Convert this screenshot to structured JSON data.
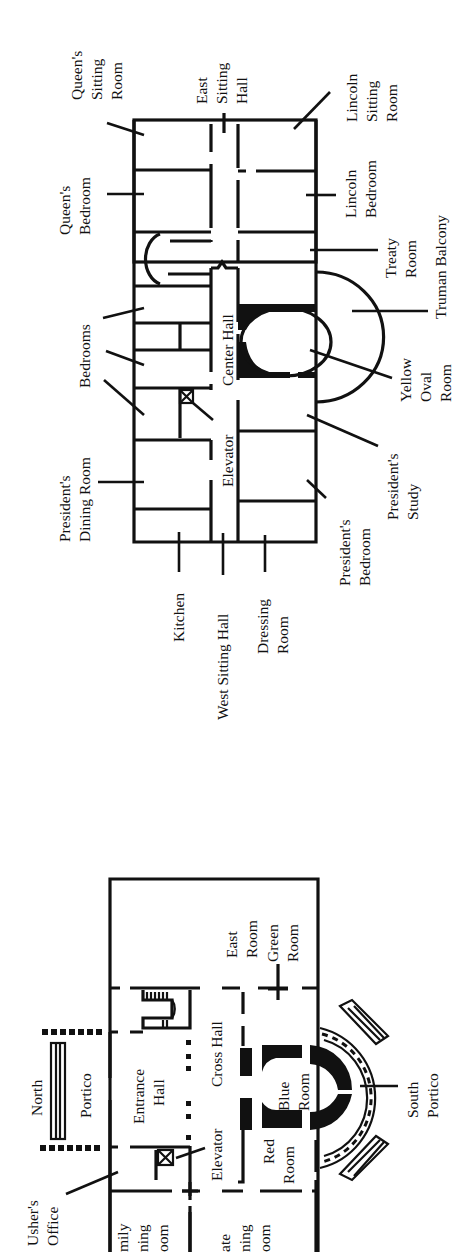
{
  "second_floor": {
    "labels": {
      "queens_sitting_room": [
        "Queen's",
        "Sitting",
        "Room"
      ],
      "queens_bedroom": [
        "Queen's",
        "Bedroom"
      ],
      "bedrooms": [
        "Bedrooms"
      ],
      "presidents_dining_room": [
        "President's",
        "Dining Room"
      ],
      "east_sitting_hall": [
        "East",
        "Sitting",
        "Hall"
      ],
      "center_hall": [
        "Center Hall"
      ],
      "elevator": [
        "Elevator"
      ],
      "lincoln_sitting_room": [
        "Lincoln",
        "Sitting",
        "Room"
      ],
      "lincoln_bedroom": [
        "Lincoln",
        "Bedroom"
      ],
      "treaty_room": [
        "Treaty",
        "Room"
      ],
      "truman_balcony": [
        "Truman Balcony"
      ],
      "yellow_oval_room": [
        "Yellow",
        "Oval",
        "Room"
      ],
      "presidents_study": [
        "President's",
        "Study"
      ],
      "presidents_bedroom": [
        "President's",
        "Bedroom"
      ],
      "kitchen": [
        "Kitchen"
      ],
      "west_sitting_hall": [
        "West Sitting Hall"
      ],
      "dressing_room": [
        "Dressing",
        "Room"
      ]
    }
  },
  "first_floor": {
    "labels": {
      "north_portico_1": [
        "North"
      ],
      "north_portico_2": [
        "Portico"
      ],
      "entrance_hall": [
        "Entrance",
        "Hall"
      ],
      "cross_hall": [
        "Cross Hall"
      ],
      "elevator": [
        "Elevator"
      ],
      "east_room": [
        "East",
        "Room"
      ],
      "green_room": [
        "Green",
        "Room"
      ],
      "blue_room": [
        "Blue",
        "Room"
      ],
      "red_room": [
        "Red",
        "Room"
      ],
      "south_portico": [
        "South",
        "Portico"
      ],
      "ushers_office": [
        "Usher's",
        "Office"
      ],
      "family_dining_room": [
        "mily",
        "ning",
        "oom"
      ],
      "state_dining_room": [
        "ate",
        "ning",
        "oom"
      ]
    }
  }
}
